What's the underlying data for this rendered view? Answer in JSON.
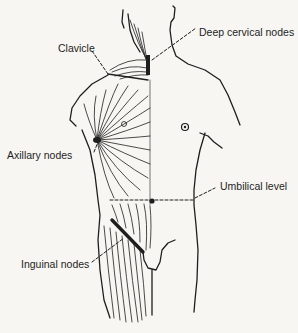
{
  "figure": {
    "colors": {
      "background": "#f7f6f2",
      "ink": "#1e1e1e"
    }
  },
  "labels": {
    "deep_cervical": "Deep cervical nodes",
    "clavicle": "Clavicle",
    "axillary": "Axillary nodes",
    "umbilical": "Umbilical level",
    "inguinal": "Inguinal nodes"
  }
}
